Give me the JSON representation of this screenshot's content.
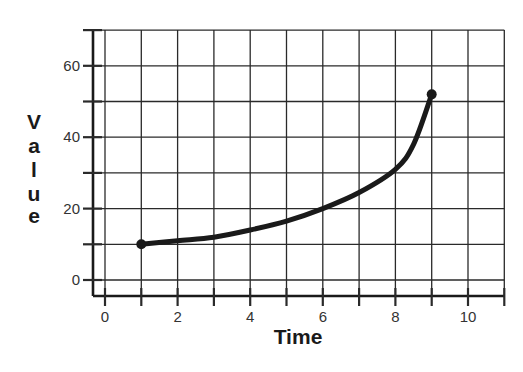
{
  "chart_data": {
    "type": "line",
    "title": "",
    "xlabel": "Time",
    "ylabel": "Value",
    "xlim": [
      -0.5,
      11
    ],
    "ylim": [
      -4,
      70
    ],
    "x_ticks": [
      0,
      1,
      2,
      3,
      4,
      5,
      6,
      7,
      8,
      9,
      10,
      11
    ],
    "x_tick_labels": [
      "0",
      "2",
      "4",
      "6",
      "8",
      "10"
    ],
    "x_tick_label_values": [
      0,
      2,
      4,
      6,
      8,
      10
    ],
    "y_ticks": [
      0,
      10,
      20,
      30,
      40,
      50,
      60,
      70
    ],
    "y_tick_labels": [
      "0",
      "20",
      "40",
      "60"
    ],
    "y_tick_label_values": [
      0,
      20,
      40,
      60
    ],
    "grid": true,
    "legend": null,
    "series": [
      {
        "name": "Value",
        "x": [
          1,
          2,
          3,
          4,
          5,
          6,
          7,
          8,
          8.5,
          9
        ],
        "values": [
          10,
          11,
          12,
          14,
          16.5,
          20,
          24.5,
          31,
          38,
          52
        ],
        "endpoints_marked": true,
        "color": "#1a1a1a"
      }
    ]
  },
  "labels": {
    "xlabel": "Time",
    "ylabel_letters": [
      "V",
      "a",
      "l",
      "u",
      "e"
    ]
  },
  "colors": {
    "line": "#1a1a1a",
    "grid": "#2a2a2a",
    "background": "#ffffff"
  }
}
